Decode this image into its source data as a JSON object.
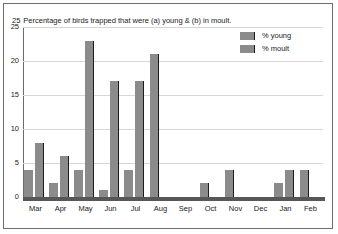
{
  "figure": {
    "title_number": "25",
    "title": "Percentage of birds trapped that were (a) young & (b) in moult."
  },
  "legend": {
    "position": "top-right",
    "items": [
      {
        "label": "% young",
        "color": "#8b8b8b"
      },
      {
        "label": "% moult",
        "color": "#8b8b8b"
      }
    ]
  },
  "axes": {
    "y_ticks": [
      "25",
      "20",
      "15",
      "10",
      "5",
      "0"
    ],
    "x_labels": [
      "Mar",
      "Apr",
      "May",
      "Jun",
      "Jul",
      "Aug",
      "Sep",
      "Oct",
      "Nov",
      "Dec",
      "Jan",
      "Feb"
    ]
  },
  "chart_data": {
    "type": "bar",
    "title": "Percentage of birds trapped that were (a) young & (b) in moult.",
    "xlabel": "",
    "ylabel": "",
    "ylim": [
      0,
      25
    ],
    "ytick_step": 5,
    "grid": true,
    "legend_position": "top-right",
    "categories": [
      "Mar",
      "Apr",
      "May",
      "Jun",
      "Jul",
      "Aug",
      "Sep",
      "Oct",
      "Nov",
      "Dec",
      "Jan",
      "Feb"
    ],
    "series": [
      {
        "name": "% young",
        "color": "#8b8b8b",
        "values": [
          4,
          2,
          4,
          1,
          4,
          0,
          0,
          0,
          0,
          0,
          2,
          0
        ]
      },
      {
        "name": "% moult",
        "color": "#8b8b8b",
        "values": [
          8,
          6,
          23,
          17,
          17,
          21,
          0,
          2,
          4,
          0,
          4,
          4
        ]
      }
    ]
  }
}
